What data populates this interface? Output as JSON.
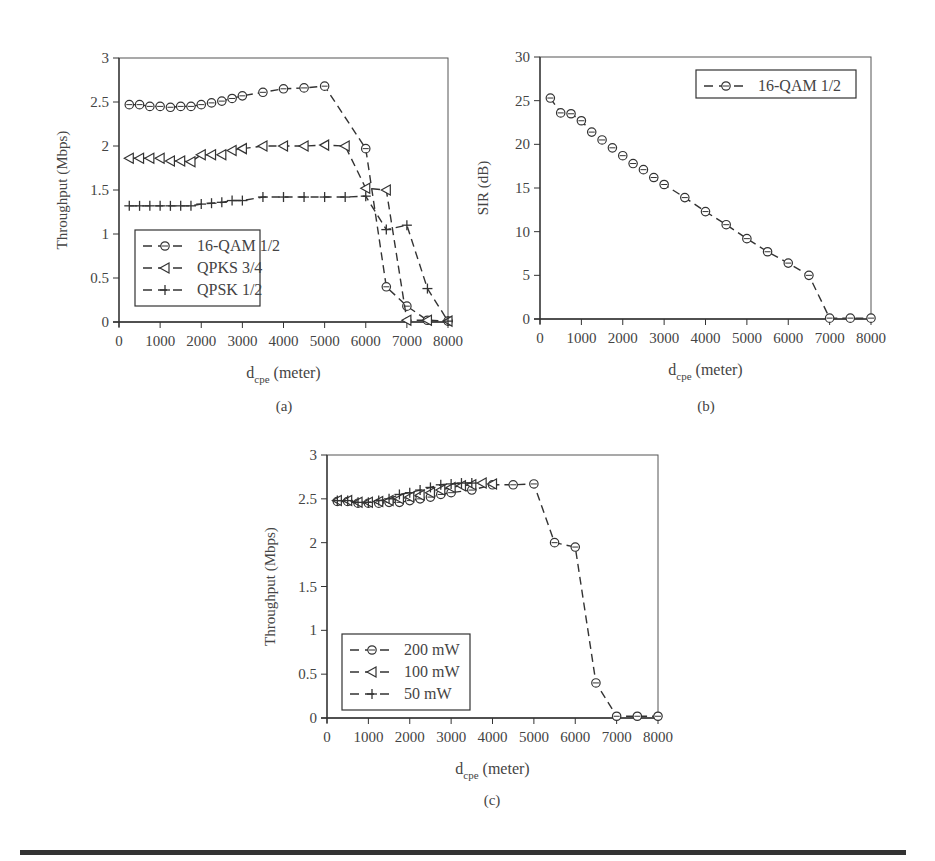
{
  "figure": {
    "captions": [
      "(a)",
      "(b)",
      "(c)"
    ]
  },
  "chart_data": [
    {
      "id": "a",
      "type": "line",
      "title": "",
      "xlabel": "d_cpe (meter)",
      "xlabel_main": "d",
      "xlabel_sub": "cpe",
      "xlabel_rest": " (meter)",
      "ylabel": "Throughput (Mbps)",
      "xlim": [
        0,
        8000
      ],
      "ylim": [
        0,
        3
      ],
      "xticks": [
        0,
        1000,
        2000,
        3000,
        4000,
        5000,
        6000,
        7000,
        8000
      ],
      "yticks": [
        0,
        0.5,
        1,
        1.5,
        2,
        2.5,
        3
      ],
      "ytick_labels": [
        "0",
        "0.5",
        "1",
        "1.5",
        "2",
        "2.5",
        "3"
      ],
      "grid": false,
      "legend_position": "lower-left",
      "series": [
        {
          "name": "16-QAM 1/2",
          "marker": "circle",
          "x": [
            250,
            500,
            750,
            1000,
            1250,
            1500,
            1750,
            2000,
            2250,
            2500,
            2750,
            3000,
            3500,
            4000,
            4500,
            5000,
            6000,
            6500,
            7000,
            7500,
            8000
          ],
          "values": [
            2.47,
            2.47,
            2.45,
            2.45,
            2.44,
            2.45,
            2.45,
            2.47,
            2.49,
            2.51,
            2.54,
            2.57,
            2.61,
            2.65,
            2.66,
            2.68,
            1.97,
            0.4,
            0.18,
            0.02,
            0.01
          ]
        },
        {
          "name": "QPKS 3/4",
          "marker": "triangle-left",
          "x": [
            250,
            500,
            750,
            1000,
            1250,
            1500,
            1750,
            2000,
            2250,
            2500,
            2750,
            3000,
            3500,
            4000,
            4500,
            5000,
            5500,
            6000,
            6500,
            7000,
            7500,
            8000
          ],
          "values": [
            1.86,
            1.86,
            1.86,
            1.86,
            1.83,
            1.83,
            1.82,
            1.9,
            1.9,
            1.9,
            1.95,
            1.97,
            2.0,
            2.0,
            2.0,
            2.01,
            2.0,
            1.52,
            1.5,
            0.02,
            0.02,
            0.01
          ]
        },
        {
          "name": "QPSK 1/2",
          "marker": "plus",
          "x": [
            250,
            500,
            750,
            1000,
            1250,
            1500,
            1750,
            2000,
            2250,
            2500,
            2750,
            3000,
            3500,
            4000,
            4500,
            5000,
            5500,
            6000,
            6500,
            7000,
            7500,
            8000
          ],
          "values": [
            1.32,
            1.32,
            1.32,
            1.32,
            1.32,
            1.32,
            1.32,
            1.34,
            1.35,
            1.36,
            1.38,
            1.38,
            1.42,
            1.42,
            1.42,
            1.42,
            1.42,
            1.43,
            1.05,
            1.1,
            0.38,
            0.01
          ]
        }
      ]
    },
    {
      "id": "b",
      "type": "line",
      "title": "",
      "xlabel": "d_cpe (meter)",
      "xlabel_main": "d",
      "xlabel_sub": "cpe",
      "xlabel_rest": " (meter)",
      "ylabel": "SIR (dB)",
      "xlim": [
        0,
        8000
      ],
      "ylim": [
        0,
        30
      ],
      "xticks": [
        0,
        1000,
        2000,
        3000,
        4000,
        5000,
        6000,
        7000,
        8000
      ],
      "yticks": [
        0,
        5,
        10,
        15,
        20,
        25,
        30
      ],
      "ytick_labels": [
        "0",
        "5",
        "10",
        "15",
        "20",
        "25",
        "30"
      ],
      "grid": false,
      "legend_position": "upper-right",
      "series": [
        {
          "name": "16-QAM 1/2",
          "marker": "circle",
          "x": [
            250,
            500,
            750,
            1000,
            1250,
            1500,
            1750,
            2000,
            2250,
            2500,
            2750,
            3000,
            3500,
            4000,
            4500,
            5000,
            5500,
            6000,
            6500,
            7000,
            7500,
            8000
          ],
          "values": [
            25.3,
            23.6,
            23.5,
            22.7,
            21.4,
            20.5,
            19.6,
            18.7,
            17.8,
            17.1,
            16.2,
            15.4,
            13.9,
            12.3,
            10.8,
            9.2,
            7.7,
            6.4,
            5.0,
            0.1,
            0.1,
            0.1
          ]
        }
      ]
    },
    {
      "id": "c",
      "type": "line",
      "title": "",
      "xlabel": "d_cpe (meter)",
      "xlabel_main": "d",
      "xlabel_sub": "cpe",
      "xlabel_rest": " (meter)",
      "ylabel": "Throughput (Mbps)",
      "xlim": [
        0,
        8000
      ],
      "ylim": [
        0,
        3
      ],
      "xticks": [
        0,
        1000,
        2000,
        3000,
        4000,
        5000,
        6000,
        7000,
        8000
      ],
      "yticks": [
        0,
        0.5,
        1,
        1.5,
        2,
        2.5,
        3
      ],
      "ytick_labels": [
        "0",
        "0.5",
        "1",
        "1.5",
        "2",
        "2.5",
        "3"
      ],
      "grid": false,
      "legend_position": "lower-left",
      "series": [
        {
          "name": "200 mW",
          "marker": "circle",
          "x": [
            250,
            500,
            750,
            1000,
            1250,
            1500,
            1750,
            2000,
            2250,
            2500,
            2750,
            3000,
            3500,
            4000,
            4500,
            5000,
            5500,
            6000,
            6500,
            7000,
            7500,
            8000
          ],
          "values": [
            2.47,
            2.47,
            2.45,
            2.45,
            2.45,
            2.46,
            2.46,
            2.48,
            2.5,
            2.52,
            2.55,
            2.57,
            2.6,
            2.66,
            2.66,
            2.67,
            2.0,
            1.95,
            0.4,
            0.02,
            0.02,
            0.02
          ]
        },
        {
          "name": "100 mW",
          "marker": "triangle-left",
          "x": [
            250,
            500,
            750,
            1000,
            1250,
            1500,
            1750,
            2000,
            2250,
            2500,
            2750,
            3000,
            3250,
            3500,
            3750,
            4000
          ],
          "values": [
            2.48,
            2.48,
            2.46,
            2.46,
            2.47,
            2.48,
            2.5,
            2.52,
            2.54,
            2.57,
            2.6,
            2.63,
            2.65,
            2.66,
            2.68,
            2.67
          ]
        },
        {
          "name": "50 mW",
          "marker": "plus",
          "x": [
            250,
            500,
            750,
            1000,
            1250,
            1500,
            1750,
            2000,
            2250,
            2500,
            2750,
            3000,
            3250,
            3500
          ],
          "values": [
            2.48,
            2.48,
            2.46,
            2.46,
            2.48,
            2.5,
            2.55,
            2.57,
            2.6,
            2.63,
            2.66,
            2.67,
            2.68,
            2.68
          ]
        }
      ]
    }
  ]
}
